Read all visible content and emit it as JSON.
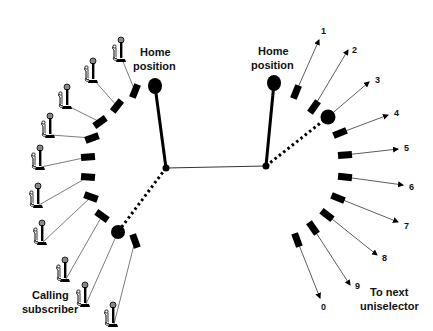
{
  "diagram": {
    "colors": {
      "ink": "#000000",
      "wire": "#555555",
      "phone_head": "#888888",
      "background": "#ffffff"
    },
    "left_unit": {
      "home_label_line1": "Home",
      "home_label_line2": "position",
      "caller_label_line1": "Calling",
      "caller_label_line2": "subscriber",
      "pivot": [
        166,
        168
      ],
      "home_wiper_end": [
        155,
        86
      ],
      "active_wiper_end": [
        118,
        232
      ],
      "contacts": [
        {
          "x": 135,
          "y": 91,
          "angle": -68,
          "phone": [
            111,
            37
          ]
        },
        {
          "x": 117,
          "y": 106,
          "angle": -52,
          "phone": [
            83,
            58
          ]
        },
        {
          "x": 100,
          "y": 122,
          "angle": -35,
          "phone": [
            57,
            84
          ]
        },
        {
          "x": 92,
          "y": 138,
          "angle": -20,
          "phone": [
            40,
            113
          ]
        },
        {
          "x": 88,
          "y": 157,
          "angle": -5,
          "phone": [
            30,
            145
          ]
        },
        {
          "x": 88,
          "y": 177,
          "angle": 5,
          "phone": [
            28,
            183
          ]
        },
        {
          "x": 91,
          "y": 197,
          "angle": 20,
          "phone": [
            32,
            220
          ]
        },
        {
          "x": 102,
          "y": 216,
          "angle": 35,
          "phone": [
            55,
            257
          ]
        },
        {
          "x": 118,
          "y": 232,
          "angle": 50,
          "phone": [
            75,
            282
          ],
          "is_wiper": true
        },
        {
          "x": 135,
          "y": 241,
          "angle": 70,
          "phone": [
            103,
            302
          ]
        }
      ]
    },
    "right_unit": {
      "home_label_line1": "Home",
      "home_label_line2": "position",
      "next_label_line1": "To next",
      "next_label_line2": "uniselector",
      "pivot": [
        266,
        166
      ],
      "home_wiper_end": [
        274,
        83
      ],
      "active_wiper_end": [
        328,
        117
      ],
      "outputs": [
        {
          "label": "1",
          "cx": 296,
          "cy": 92,
          "angle": -68,
          "arrow": [
            319,
            40
          ],
          "text": [
            321,
            34
          ]
        },
        {
          "label": "2",
          "cx": 314,
          "cy": 107,
          "angle": -55,
          "arrow": [
            348,
            50
          ],
          "text": [
            352,
            53
          ]
        },
        {
          "label": "3",
          "cx": 328,
          "cy": 117,
          "angle": -40,
          "arrow": [
            369,
            82
          ],
          "text": [
            375,
            83
          ],
          "is_wiper": true
        },
        {
          "label": "4",
          "cx": 340,
          "cy": 133,
          "angle": -22,
          "arrow": [
            388,
            115
          ],
          "text": [
            394,
            116
          ]
        },
        {
          "label": "5",
          "cx": 345,
          "cy": 155,
          "angle": -5,
          "arrow": [
            398,
            149
          ],
          "text": [
            404,
            151
          ]
        },
        {
          "label": "6",
          "cx": 345,
          "cy": 177,
          "angle": 6,
          "arrow": [
            403,
            185
          ],
          "text": [
            409,
            190
          ]
        },
        {
          "label": "7",
          "cx": 338,
          "cy": 198,
          "angle": 22,
          "arrow": [
            398,
            222
          ],
          "text": [
            404,
            229
          ]
        },
        {
          "label": "8",
          "cx": 327,
          "cy": 215,
          "angle": 38,
          "arrow": [
            377,
            255
          ],
          "text": [
            382,
            261
          ]
        },
        {
          "label": "9",
          "cx": 313,
          "cy": 228,
          "angle": 55,
          "arrow": [
            350,
            285
          ],
          "text": [
            355,
            289
          ]
        },
        {
          "label": "0",
          "cx": 297,
          "cy": 240,
          "angle": 70,
          "arrow": [
            320,
            298
          ],
          "text": [
            321,
            310
          ]
        }
      ]
    },
    "link_line": {
      "from": [
        166,
        168
      ],
      "to": [
        266,
        166
      ]
    }
  }
}
